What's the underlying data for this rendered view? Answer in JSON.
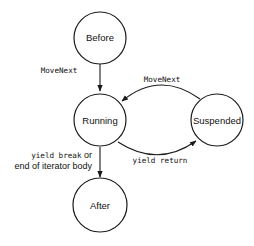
{
  "diagram": {
    "type": "state-machine",
    "nodes": {
      "before": {
        "label": "Before"
      },
      "running": {
        "label": "Running"
      },
      "suspended": {
        "label": "Suspended"
      },
      "after": {
        "label": "After"
      }
    },
    "edges": {
      "before_to_running": {
        "from": "Before",
        "to": "Running",
        "label": "MoveNext"
      },
      "suspended_to_running": {
        "from": "Suspended",
        "to": "Running",
        "label": "MoveNext"
      },
      "running_to_suspended": {
        "from": "Running",
        "to": "Suspended",
        "label": "yield return"
      },
      "running_to_after": {
        "from": "Running",
        "to": "After",
        "label_line1": "yield break",
        "label_line1_suffix": " or",
        "label_line2": "end of iterator body"
      }
    },
    "colors": {
      "stroke": "#1a1a1a",
      "background": "#ffffff"
    }
  }
}
